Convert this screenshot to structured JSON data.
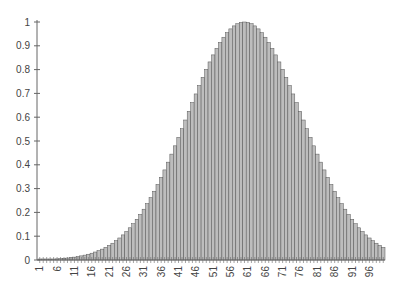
{
  "chart_data": {
    "type": "bar",
    "title": "",
    "xlabel": "",
    "ylabel": "",
    "ylim": [
      0,
      1
    ],
    "yticks": [
      "0",
      "0.1",
      "0.2",
      "0.3",
      "0.4",
      "0.5",
      "0.6",
      "0.7",
      "0.8",
      "0.9",
      "1"
    ],
    "xtick_labels": [
      "1",
      "6",
      "11",
      "16",
      "21",
      "26",
      "31",
      "36",
      "41",
      "46",
      "51",
      "56",
      "61",
      "66",
      "71",
      "76",
      "81",
      "86",
      "91",
      "96"
    ],
    "grid": false,
    "legend": null,
    "bar_color": "#bdbdbd",
    "bar_edge_color": "#555555",
    "distribution": {
      "shape": "gaussian",
      "peak_index": 60,
      "sigma": 16.5,
      "peak_value": 1.0
    },
    "categories_count": 100,
    "values": [
      0.0012,
      0.0016,
      0.002,
      0.0026,
      0.0033,
      0.0041,
      0.0052,
      0.0064,
      0.008,
      0.0098,
      0.012,
      0.0147,
      0.0178,
      0.0215,
      0.0259,
      0.031,
      0.0369,
      0.0438,
      0.0516,
      0.0606,
      0.0707,
      0.0821,
      0.0949,
      0.1092,
      0.125,
      0.1424,
      0.1614,
      0.1821,
      0.2045,
      0.2286,
      0.2544,
      0.2817,
      0.3107,
      0.3411,
      0.3729,
      0.406,
      0.4401,
      0.4752,
      0.511,
      0.5473,
      0.5838,
      0.6203,
      0.6564,
      0.6919,
      0.7264,
      0.7596,
      0.7912,
      0.8208,
      0.8481,
      0.8729,
      0.8948,
      0.9136,
      0.9291,
      0.9412,
      0.9497,
      0.9546,
      0.96,
      0.975,
      0.989,
      0.9972,
      1.0,
      0.9972,
      0.989,
      0.975,
      0.96,
      0.9412,
      0.9198,
      0.8948,
      0.8667,
      0.836,
      0.803,
      0.7681,
      0.7317,
      0.6942,
      0.656,
      0.6176,
      0.5793,
      0.5415,
      0.5044,
      0.4683,
      0.4335,
      0.4001,
      0.3683,
      0.3382,
      0.3099,
      0.2834,
      0.2587,
      0.2358,
      0.2146,
      0.1951,
      0.1772,
      0.1608,
      0.1458,
      0.1322,
      0.1198,
      0.1085,
      0.0983,
      0.089,
      0.0805,
      0.0729
    ]
  }
}
